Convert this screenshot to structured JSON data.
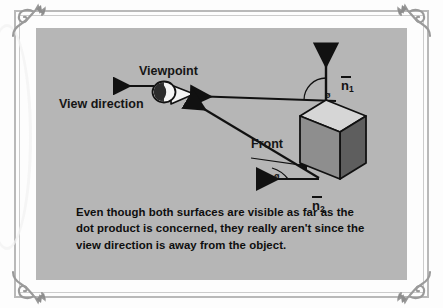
{
  "figure": {
    "panel_background": "#b6b6b6",
    "diagram": {
      "labels": {
        "viewpoint": "Viewpoint",
        "view_direction": "View direction",
        "front": "Front"
      },
      "vectors": [
        {
          "id": "n1",
          "symbol": "n",
          "subscript": "1",
          "overbar": true,
          "description": "normal-vector-top-face"
        },
        {
          "id": "n2",
          "symbol": "n",
          "subscript": "2",
          "overbar": true,
          "description": "normal-vector-front-face"
        }
      ],
      "angle_markers": [
        {
          "id": "angle-1",
          "symbol": "ø"
        },
        {
          "id": "angle-2",
          "symbol": "ø"
        }
      ],
      "icons": {
        "eye": "eye-icon",
        "view_direction_arrow": "arrow-left-icon",
        "front_arrow": "arrow-right-icon"
      },
      "cube": {
        "top_face_color": "#d6d6d6",
        "front_face_color": "#8e8e8e",
        "side_face_color": "#5e5e5e",
        "outline_color": "#111111"
      },
      "line_color": "#111111"
    }
  },
  "caption": {
    "text": "Even though both surfaces are visible as far as the dot product is concerned, they really aren't since the view direction is away from the object."
  },
  "border": {
    "ornament": "corner-flourish-ornament",
    "outer_color": "#b9b9b9",
    "inner_color": "#cccccc"
  }
}
